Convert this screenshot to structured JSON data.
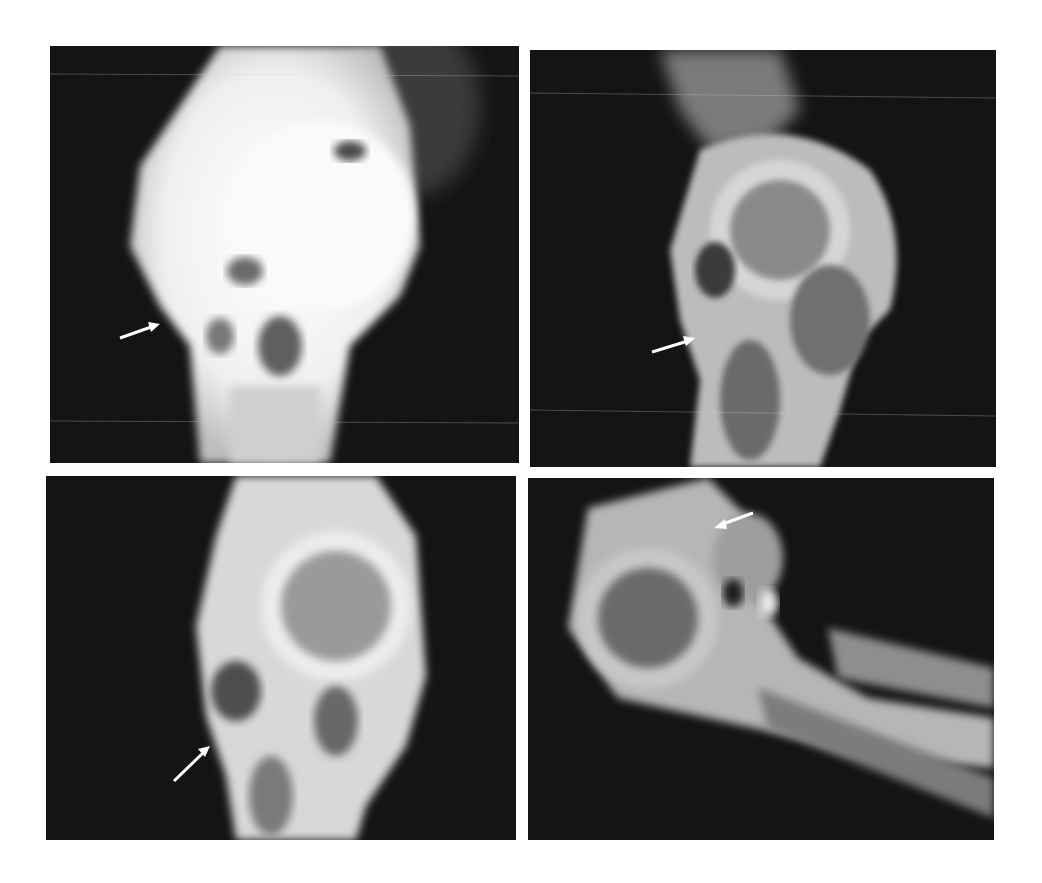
{
  "figure": {
    "type": "radiograph-panel-grid",
    "layout": "2x2",
    "background": "#ffffff",
    "panels": [
      {
        "position": "top-left",
        "subject": "joint radiograph, dense soft tissue overlay",
        "annotations": [
          {
            "type": "arrow",
            "direction": "pointing up-right",
            "color": "#ffffff"
          }
        ]
      },
      {
        "position": "top-right",
        "subject": "joint radiograph, articular head with bone shaft",
        "annotations": [
          {
            "type": "arrow",
            "direction": "pointing up-right",
            "color": "#ffffff"
          }
        ]
      },
      {
        "position": "bottom-left",
        "subject": "joint radiograph, lateral view",
        "annotations": [
          {
            "type": "arrow",
            "direction": "pointing up-right",
            "color": "#ffffff"
          }
        ]
      },
      {
        "position": "bottom-right",
        "subject": "joint radiograph, flexed with two long bones",
        "annotations": [
          {
            "type": "arrow",
            "direction": "pointing down-left",
            "color": "#ffffff"
          }
        ]
      }
    ]
  },
  "colors": {
    "film_dark": "#141414",
    "bone_bright": "#f2f2f2",
    "bone_mid": "#9a9a9a",
    "arrow": "#ffffff"
  }
}
